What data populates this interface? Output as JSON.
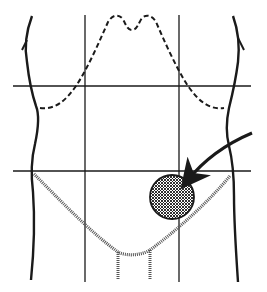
{
  "diagram": {
    "type": "abdominal-regions-anatomy",
    "colors": {
      "ink": "#1a1a1a",
      "background": "#ffffff"
    },
    "grid": {
      "vertical_x": [
        85,
        179
      ],
      "horizontal_y": [
        86,
        171
      ]
    },
    "marker": {
      "shape": "circle",
      "fill": "cross-hatched",
      "cx": 172,
      "cy": 197,
      "r": 22,
      "region": "lower-right"
    },
    "arrow": {
      "from": [
        252,
        133
      ],
      "to": [
        185,
        183
      ]
    }
  }
}
